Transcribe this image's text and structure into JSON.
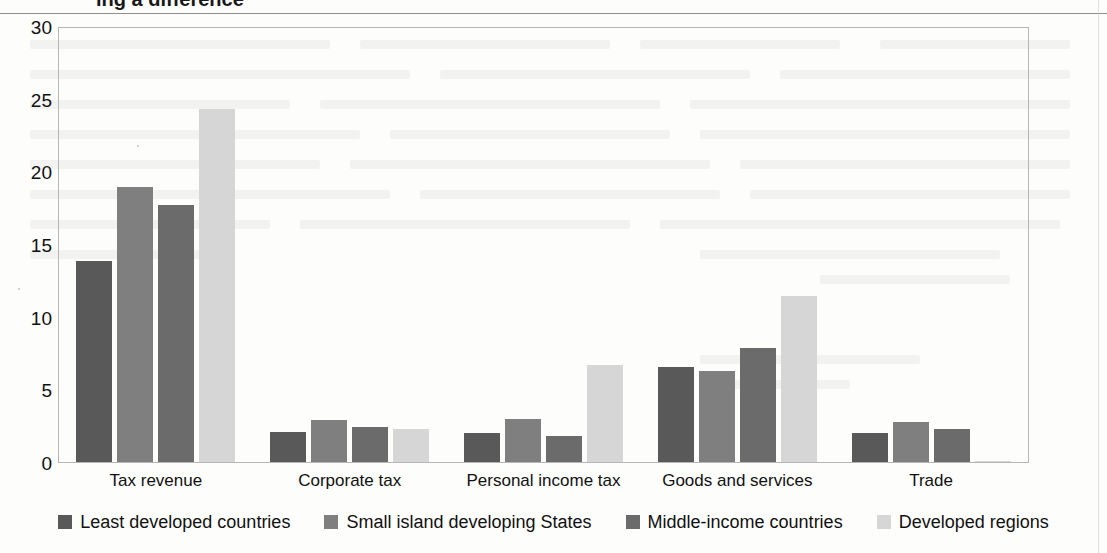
{
  "page": {
    "clipped_heading": "ing a difference",
    "top_rule": "horizontal-rule"
  },
  "chart_data": {
    "type": "bar",
    "title": "",
    "subtitle": "",
    "xlabel": "",
    "ylabel": "",
    "ylim": [
      0,
      30
    ],
    "yticks": [
      30,
      25,
      20,
      15,
      10,
      5,
      0
    ],
    "grid": false,
    "legend_position": "bottom",
    "categories": [
      "Tax revenue",
      "Corporate tax",
      "Personal income tax",
      "Goods and services",
      "Trade"
    ],
    "series": [
      {
        "name": "Least developed countries",
        "color": "#595959",
        "values": [
          13.9,
          2.1,
          2.0,
          6.6,
          2.0
        ]
      },
      {
        "name": "Small island developing States",
        "color": "#7f7f7f",
        "values": [
          19.0,
          2.9,
          3.0,
          6.3,
          2.8
        ]
      },
      {
        "name": "Middle-income countries",
        "color": "#6b6b6b",
        "values": [
          17.8,
          2.4,
          1.8,
          7.9,
          2.3
        ]
      },
      {
        "name": "Developed regions",
        "color": "#d6d6d6",
        "values": [
          24.4,
          2.3,
          6.7,
          11.5,
          0.1
        ]
      }
    ]
  }
}
